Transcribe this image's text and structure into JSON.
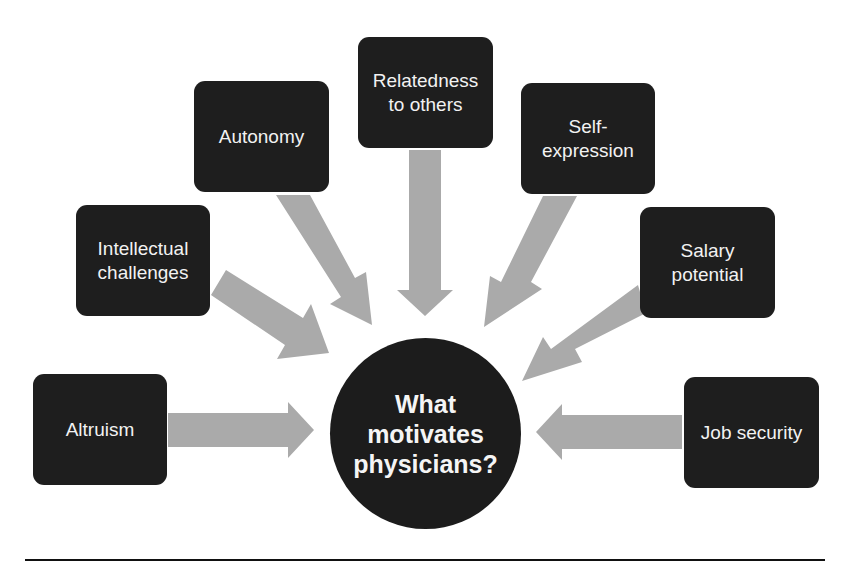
{
  "diagram": {
    "center": {
      "label": "What\nmotivates\nphysicians?"
    },
    "factors": [
      {
        "id": "altruism",
        "label": "Altruism"
      },
      {
        "id": "intellectual",
        "label": "Intellectual\nchallenges"
      },
      {
        "id": "autonomy",
        "label": "Autonomy"
      },
      {
        "id": "relatedness",
        "label": "Relatedness\nto others"
      },
      {
        "id": "self-expression",
        "label": "Self-\nexpression"
      },
      {
        "id": "salary",
        "label": "Salary\npotential"
      },
      {
        "id": "job-security",
        "label": "Job security"
      }
    ],
    "colors": {
      "box": "#1e1e1e",
      "arrow": "#aaaaaa",
      "text": "#f2f2f2",
      "rule": "#111111"
    }
  }
}
